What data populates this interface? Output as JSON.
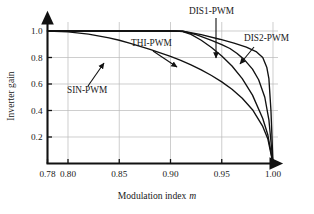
{
  "chart_data": {
    "type": "line",
    "title": "",
    "xlabel": "Modulation index m",
    "ylabel": "Inverter gain",
    "xlim": [
      0.78,
      1.005
    ],
    "ylim": [
      0.0,
      1.05
    ],
    "grid": true,
    "legend_position": "inline-annotations",
    "xticks": [
      "0.78",
      "0.80",
      "0.85",
      "0.90",
      "0.95",
      "1.00"
    ],
    "xtick_values": [
      0.78,
      0.8,
      0.85,
      0.9,
      0.95,
      1.0
    ],
    "yticks": [
      "0.2",
      "0.4",
      "0.6",
      "0.8",
      "1.0"
    ],
    "ytick_values": [
      0.2,
      0.4,
      0.6,
      0.8,
      1.0
    ],
    "series": [
      {
        "name": "SIN-PWM",
        "x": [
          0.78,
          0.8,
          0.82,
          0.84,
          0.85,
          0.86,
          0.88,
          0.9,
          0.91,
          0.92,
          0.93,
          0.94,
          0.95,
          0.96,
          0.97,
          0.98,
          0.99,
          0.995,
          1.0
        ],
        "y": [
          1.0,
          0.993,
          0.976,
          0.948,
          0.93,
          0.908,
          0.862,
          0.808,
          0.778,
          0.744,
          0.706,
          0.664,
          0.616,
          0.56,
          0.492,
          0.406,
          0.28,
          0.185,
          0.0
        ]
      },
      {
        "name": "THI-PWM",
        "x": [
          0.78,
          0.85,
          0.89,
          0.905,
          0.912,
          0.92,
          0.93,
          0.94,
          0.95,
          0.96,
          0.97,
          0.98,
          0.99,
          0.995,
          1.0
        ],
        "y": [
          1.0,
          1.0,
          1.0,
          1.0,
          0.996,
          0.975,
          0.93,
          0.876,
          0.812,
          0.736,
          0.64,
          0.516,
          0.34,
          0.215,
          0.0
        ]
      },
      {
        "name": "DIS1-PWM",
        "x": [
          0.78,
          0.85,
          0.9,
          0.912,
          0.925,
          0.94,
          0.95,
          0.958,
          0.965,
          0.972,
          0.98,
          0.986,
          0.992,
          0.996,
          1.0
        ],
        "y": [
          1.0,
          1.0,
          1.0,
          0.998,
          0.972,
          0.93,
          0.898,
          0.868,
          0.83,
          0.784,
          0.712,
          0.632,
          0.5,
          0.33,
          0.0
        ]
      },
      {
        "name": "DIS2-PWM",
        "x": [
          0.78,
          0.85,
          0.9,
          0.912,
          0.93,
          0.948,
          0.962,
          0.974,
          0.984,
          0.99,
          0.994,
          0.996,
          0.998,
          0.999,
          1.0
        ],
        "y": [
          1.0,
          1.0,
          1.0,
          0.998,
          0.972,
          0.938,
          0.908,
          0.878,
          0.842,
          0.8,
          0.724,
          0.64,
          0.4,
          0.2,
          0.0
        ]
      }
    ],
    "annotations": [
      {
        "text": "SIN-PWM",
        "label_x": 67,
        "label_y": 93,
        "arrow_from_x": 88,
        "arrow_from_y": 86,
        "arrow_to_x": 104,
        "arrow_to_y": 63
      },
      {
        "text": "THI-PWM",
        "label_x": 131,
        "label_y": 46,
        "arrow_from_x": 153,
        "arrow_from_y": 51,
        "arrow_to_x": 177,
        "arrow_to_y": 67
      },
      {
        "text": "DIS1-PWM",
        "label_x": 189,
        "label_y": 14,
        "arrow_from_x": 216,
        "arrow_from_y": 18,
        "arrow_to_x": 216,
        "arrow_to_y": 58
      },
      {
        "text": "DIS2-PWM",
        "label_x": 244,
        "label_y": 41,
        "arrow_from_x": 254,
        "arrow_from_y": 47,
        "arrow_to_x": 240,
        "arrow_to_y": 64
      }
    ]
  }
}
